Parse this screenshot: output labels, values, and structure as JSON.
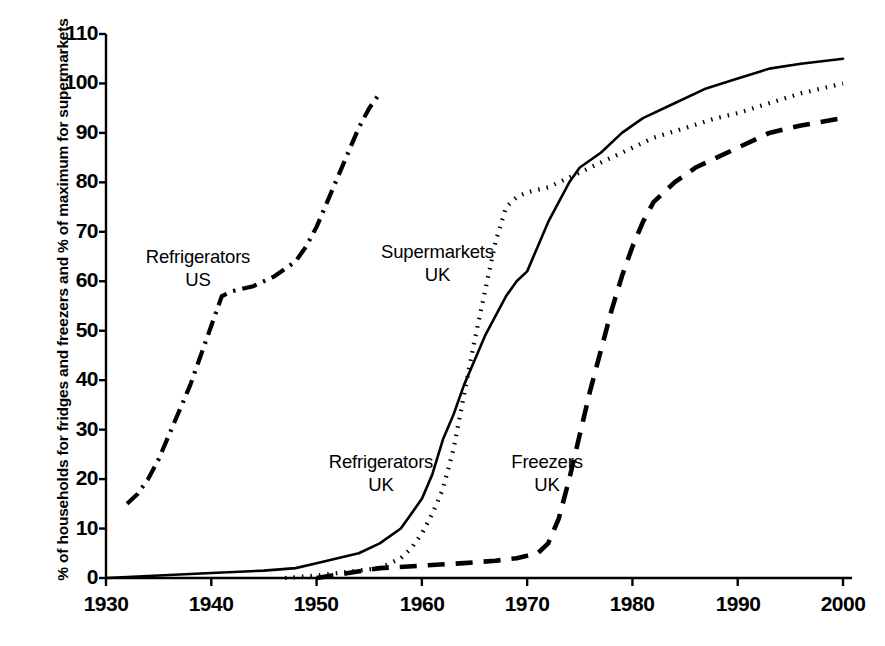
{
  "chart_data": {
    "type": "line",
    "title": "",
    "xlabel": "",
    "ylabel": "% of households for fridges and freezers and % of maximum for supermarkets",
    "xlim": [
      1930,
      2000
    ],
    "ylim": [
      0,
      110
    ],
    "xticks": [
      1930,
      1940,
      1950,
      1960,
      1970,
      1980,
      1990,
      2000
    ],
    "yticks": [
      0,
      10,
      20,
      30,
      40,
      50,
      60,
      70,
      80,
      90,
      100,
      110
    ],
    "grid": false,
    "legend_position": "inline-annotations",
    "series": [
      {
        "name": "Refrigerators US",
        "label_lines": [
          "Refrigerators",
          "US"
        ],
        "style": "dash-dot",
        "color": "#000000",
        "points": [
          [
            1932,
            15
          ],
          [
            1933,
            17
          ],
          [
            1934,
            20
          ],
          [
            1935,
            24
          ],
          [
            1936,
            29
          ],
          [
            1937,
            34
          ],
          [
            1938,
            39
          ],
          [
            1939,
            45
          ],
          [
            1940,
            51
          ],
          [
            1941,
            57
          ],
          [
            1942,
            58
          ],
          [
            1944,
            59
          ],
          [
            1946,
            61
          ],
          [
            1948,
            64
          ],
          [
            1949,
            67
          ],
          [
            1950,
            71
          ],
          [
            1951,
            76
          ],
          [
            1952,
            81
          ],
          [
            1953,
            86
          ],
          [
            1954,
            91
          ],
          [
            1955,
            95
          ],
          [
            1956,
            98
          ]
        ]
      },
      {
        "name": "Supermarkets UK",
        "label_lines": [
          "Supermarkets",
          "UK"
        ],
        "style": "dotted",
        "color": "#000000",
        "points": [
          [
            1947,
            0
          ],
          [
            1950,
            0.5
          ],
          [
            1952,
            1
          ],
          [
            1954,
            1.5
          ],
          [
            1956,
            2
          ],
          [
            1958,
            4
          ],
          [
            1959,
            6
          ],
          [
            1960,
            9
          ],
          [
            1961,
            13
          ],
          [
            1962,
            18
          ],
          [
            1963,
            26
          ],
          [
            1964,
            37
          ],
          [
            1965,
            48
          ],
          [
            1966,
            58
          ],
          [
            1967,
            68
          ],
          [
            1968,
            75
          ],
          [
            1969,
            77
          ],
          [
            1970,
            78
          ],
          [
            1972,
            79
          ],
          [
            1974,
            81
          ],
          [
            1976,
            83
          ],
          [
            1978,
            85
          ],
          [
            1980,
            87
          ],
          [
            1982,
            89
          ],
          [
            1985,
            91
          ],
          [
            1988,
            93
          ],
          [
            1990,
            94
          ],
          [
            1993,
            96
          ],
          [
            1996,
            98
          ],
          [
            2000,
            100
          ]
        ]
      },
      {
        "name": "Refrigerators UK",
        "label_lines": [
          "Refrigerators",
          "UK"
        ],
        "style": "solid",
        "color": "#000000",
        "points": [
          [
            1930,
            0
          ],
          [
            1935,
            0.5
          ],
          [
            1940,
            1
          ],
          [
            1945,
            1.5
          ],
          [
            1948,
            2
          ],
          [
            1950,
            3
          ],
          [
            1952,
            4
          ],
          [
            1954,
            5
          ],
          [
            1956,
            7
          ],
          [
            1958,
            10
          ],
          [
            1959,
            13
          ],
          [
            1960,
            16
          ],
          [
            1961,
            21
          ],
          [
            1962,
            28
          ],
          [
            1963,
            33
          ],
          [
            1964,
            39
          ],
          [
            1965,
            44
          ],
          [
            1966,
            49
          ],
          [
            1967,
            53
          ],
          [
            1968,
            57
          ],
          [
            1969,
            60
          ],
          [
            1970,
            62
          ],
          [
            1971,
            67
          ],
          [
            1972,
            72
          ],
          [
            1973,
            76
          ],
          [
            1974,
            80
          ],
          [
            1975,
            83
          ],
          [
            1977,
            86
          ],
          [
            1979,
            90
          ],
          [
            1981,
            93
          ],
          [
            1984,
            96
          ],
          [
            1987,
            99
          ],
          [
            1990,
            101
          ],
          [
            1993,
            103
          ],
          [
            1996,
            104
          ],
          [
            2000,
            105
          ]
        ]
      },
      {
        "name": "Freezers UK",
        "label_lines": [
          "Freezers",
          "UK"
        ],
        "style": "dashed",
        "color": "#000000",
        "points": [
          [
            1950,
            0
          ],
          [
            1953,
            1
          ],
          [
            1956,
            2
          ],
          [
            1960,
            2.5
          ],
          [
            1964,
            3
          ],
          [
            1967,
            3.5
          ],
          [
            1969,
            4
          ],
          [
            1970,
            4.5
          ],
          [
            1971,
            5
          ],
          [
            1972,
            7
          ],
          [
            1973,
            12
          ],
          [
            1974,
            20
          ],
          [
            1975,
            29
          ],
          [
            1976,
            38
          ],
          [
            1977,
            46
          ],
          [
            1978,
            54
          ],
          [
            1979,
            61
          ],
          [
            1980,
            67
          ],
          [
            1981,
            72
          ],
          [
            1982,
            76
          ],
          [
            1984,
            80
          ],
          [
            1986,
            83
          ],
          [
            1988,
            85
          ],
          [
            1990,
            87
          ],
          [
            1993,
            90
          ],
          [
            1996,
            91.5
          ],
          [
            2000,
            93
          ]
        ]
      }
    ]
  },
  "axis": {
    "y_title": "% of households for fridges and freezers and % of maximum for supermarkets",
    "y_ticks": [
      "0",
      "10",
      "20",
      "30",
      "40",
      "50",
      "60",
      "70",
      "80",
      "90",
      "100",
      "110"
    ],
    "x_ticks": [
      "1930",
      "1940",
      "1950",
      "1960",
      "1970",
      "1980",
      "1990",
      "2000"
    ]
  },
  "annotations": {
    "refrigerators_us": "Refrigerators\nUS",
    "supermarkets_uk": "Supermarkets\nUK",
    "refrigerators_uk": "Refrigerators\nUK",
    "freezers_uk": "Freezers\nUK"
  }
}
